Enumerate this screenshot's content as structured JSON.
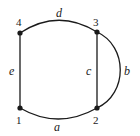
{
  "graph": {
    "vertices": [
      {
        "id": "1",
        "label": "1"
      },
      {
        "id": "2",
        "label": "2"
      },
      {
        "id": "3",
        "label": "3"
      },
      {
        "id": "4",
        "label": "4"
      }
    ],
    "edges": [
      {
        "id": "a",
        "label": "a",
        "from": "1",
        "to": "2",
        "shape": "curve-down"
      },
      {
        "id": "b",
        "label": "b",
        "from": "3",
        "to": "2",
        "shape": "curve-right"
      },
      {
        "id": "c",
        "label": "c",
        "from": "3",
        "to": "2",
        "shape": "straight"
      },
      {
        "id": "d",
        "label": "d",
        "from": "4",
        "to": "3",
        "shape": "curve-up"
      },
      {
        "id": "e",
        "label": "e",
        "from": "4",
        "to": "1",
        "shape": "straight"
      }
    ],
    "colors": {
      "stroke": "#1a1a1a",
      "background": "#ffffff"
    }
  }
}
